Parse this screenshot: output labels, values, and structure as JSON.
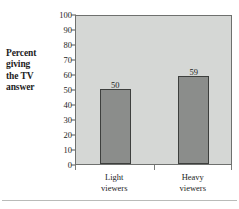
{
  "chart_data": {
    "type": "bar",
    "title": "",
    "xlabel": "",
    "ylabel": "Percent giving the TV answer",
    "ylabel_lines": [
      "Percent",
      "giving",
      "the TV",
      "answer"
    ],
    "categories": [
      "Light viewers",
      "Heavy viewers"
    ],
    "category_lines": [
      [
        "Light",
        "viewers"
      ],
      [
        "Heavy",
        "viewers"
      ]
    ],
    "values": [
      50,
      59
    ],
    "value_labels": [
      "50",
      "59"
    ],
    "ylim": [
      0,
      100
    ],
    "ytick_step": 10,
    "yticks": [
      100,
      90,
      80,
      70,
      60,
      50,
      40,
      30,
      20,
      10,
      0
    ],
    "ytick_labels": [
      "100",
      "90",
      "80",
      "70",
      "60",
      "50",
      "40",
      "30",
      "20",
      "10",
      "0"
    ],
    "grid": false,
    "legend": "none",
    "colors": {
      "bar_fill": "#8b8d8b",
      "bar_border": "#3d3f3d",
      "plot_background": "#d5d7d5",
      "plot_border": "#6e706e",
      "text": "#1d1d1d",
      "page_background": "#ffffff",
      "footer_rule": "#b9bbb9"
    }
  }
}
